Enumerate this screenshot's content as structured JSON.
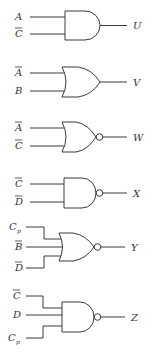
{
  "diagram": {
    "type": "logic-gates",
    "gates": [
      {
        "id": "U",
        "type": "AND",
        "output": "U",
        "inputs": [
          {
            "name": "A",
            "bar": false,
            "sub": ""
          },
          {
            "name": "C",
            "bar": true,
            "sub": ""
          }
        ]
      },
      {
        "id": "V",
        "type": "OR",
        "output": "V",
        "inputs": [
          {
            "name": "A",
            "bar": true,
            "sub": ""
          },
          {
            "name": "B",
            "bar": false,
            "sub": ""
          }
        ]
      },
      {
        "id": "W",
        "type": "NOR",
        "output": "W",
        "inputs": [
          {
            "name": "A",
            "bar": true,
            "sub": ""
          },
          {
            "name": "C",
            "bar": true,
            "sub": ""
          }
        ]
      },
      {
        "id": "X",
        "type": "NAND",
        "output": "X",
        "inputs": [
          {
            "name": "C",
            "bar": true,
            "sub": ""
          },
          {
            "name": "D",
            "bar": true,
            "sub": ""
          }
        ]
      },
      {
        "id": "Y",
        "type": "NOR",
        "output": "Y",
        "inputs": [
          {
            "name": "C",
            "bar": false,
            "sub": "p"
          },
          {
            "name": "B",
            "bar": true,
            "sub": ""
          },
          {
            "name": "D",
            "bar": true,
            "sub": ""
          }
        ]
      },
      {
        "id": "Z",
        "type": "NAND",
        "output": "Z",
        "inputs": [
          {
            "name": "C",
            "bar": true,
            "sub": ""
          },
          {
            "name": "D",
            "bar": false,
            "sub": ""
          },
          {
            "name": "C",
            "bar": false,
            "sub": "p"
          }
        ]
      }
    ]
  },
  "labels": {
    "U": {
      "out": "U",
      "in0": "A",
      "in1": "C"
    },
    "V": {
      "out": "V",
      "in0": "A",
      "in1": "B"
    },
    "W": {
      "out": "W",
      "in0": "A",
      "in1": "C"
    },
    "X": {
      "out": "X",
      "in0": "C",
      "in1": "D"
    },
    "Y": {
      "out": "Y",
      "in0": "C",
      "in0_sub": "p",
      "in1": "B",
      "in2": "D"
    },
    "Z": {
      "out": "Z",
      "in0": "C",
      "in1": "D",
      "in2": "C",
      "in2_sub": "p"
    }
  }
}
